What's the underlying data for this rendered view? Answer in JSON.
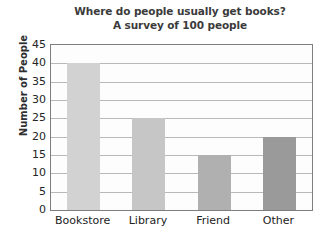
{
  "chart_data": {
    "type": "bar",
    "title": "Where do people usually get books?",
    "subtitle": "A survey of 100 people",
    "xlabel": "",
    "ylabel": "Number of People",
    "categories": [
      "Bookstore",
      "Library",
      "Friend",
      "Other"
    ],
    "values": [
      40,
      25,
      15,
      20
    ],
    "ylim": [
      0,
      45
    ],
    "ytick_step": 5,
    "ytick_labels": [
      "0",
      "5",
      "10",
      "15",
      "20",
      "25",
      "30",
      "35",
      "40",
      "45"
    ],
    "grid": true,
    "legend": "none",
    "bar_colors": [
      "#d2d2d2",
      "#c6c6c6",
      "#b0b0b0",
      "#9a9a9a"
    ],
    "axis_color": "#7e7e7e",
    "gridline_color": "#b9b9b9",
    "title_color": "#3b3b3b",
    "plot_background": "#fdfdfd"
  }
}
